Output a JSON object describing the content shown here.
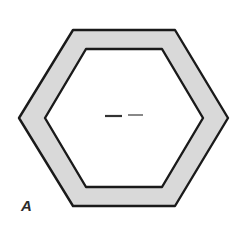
{
  "figure": {
    "panel_label": "A",
    "caption_text": "",
    "background_color": "#ffffff"
  },
  "chart_data": {
    "type": "diagram",
    "title": "",
    "subtitle": "",
    "xlabel": "",
    "ylabel": "",
    "annotations": [
      "A"
    ],
    "legend": [],
    "grid": false,
    "shapes": [
      {
        "name": "outer-hexagon",
        "role": "outer boundary of hexagonal wall",
        "sides": 6,
        "orientation": "flat-top",
        "fill": "#d9d9d9",
        "stroke": "#1a1a1a",
        "stroke_width": 2,
        "vertices": [
          [
            73,
            30
          ],
          [
            175,
            30
          ],
          [
            228,
            118
          ],
          [
            175,
            206
          ],
          [
            73,
            206
          ],
          [
            19,
            118
          ]
        ]
      },
      {
        "name": "inner-hexagon",
        "role": "inner boundary (hollow lumen) of hexagonal wall",
        "sides": 6,
        "orientation": "flat-top",
        "fill": "#ffffff",
        "stroke": "#1a1a1a",
        "stroke_width": 2,
        "vertices": [
          [
            86,
            49
          ],
          [
            162,
            49
          ],
          [
            203,
            118
          ],
          [
            162,
            187
          ],
          [
            86,
            187
          ],
          [
            45,
            118
          ]
        ]
      }
    ],
    "marks": [
      {
        "name": "center-mark-left",
        "type": "horizontal-dash",
        "x1": 105,
        "x2": 122,
        "y": 116,
        "thickness": 2.2,
        "color": "#333333"
      },
      {
        "name": "center-mark-right",
        "type": "horizontal-dash",
        "x1": 128,
        "x2": 143,
        "y": 115,
        "thickness": 1.4,
        "color": "#555555"
      }
    ],
    "colors": {
      "wall_fill": "#d9d9d9",
      "lumen_fill": "#ffffff",
      "outline": "#1a1a1a",
      "label": "#2b2b2b",
      "background": "#ffffff"
    }
  }
}
